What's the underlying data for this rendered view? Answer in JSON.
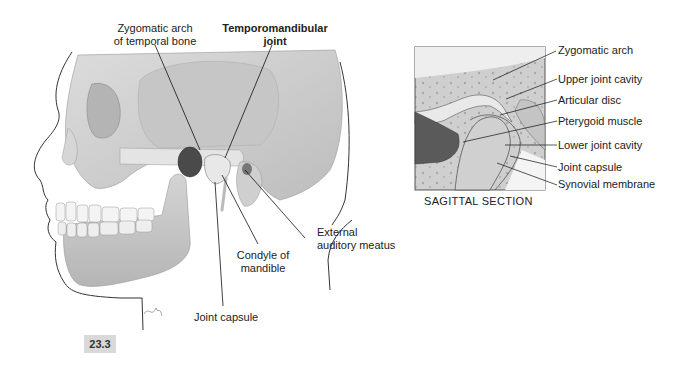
{
  "figure": {
    "number": "23.3",
    "title": "Temporomandibular joint"
  },
  "lateral_view": {
    "labels": {
      "zygomatic_arch_line1": "Zygomatic arch",
      "zygomatic_arch_line2": "of temporal bone",
      "tmj_line1": "Temporomandibular",
      "tmj_line2": "joint",
      "external_auditory_line1": "External",
      "external_auditory_line2": "auditory meatus",
      "condyle_line1": "Condyle of",
      "condyle_line2": "mandible",
      "joint_capsule": "Joint capsule"
    }
  },
  "sagittal_section": {
    "caption": "SAGITTAL SECTION",
    "labels": [
      "Zygomatic arch",
      "Upper joint cavity",
      "Articular disc",
      "Pterygoid muscle",
      "Lower joint cavity",
      "Joint capsule",
      "Synovial membrane"
    ]
  },
  "colors": {
    "bone": "#c8c8c8",
    "bone_light": "#e2e2e2",
    "muscle": "#5a5a5a",
    "outline": "#222222",
    "badge": "#d9d9d9"
  }
}
